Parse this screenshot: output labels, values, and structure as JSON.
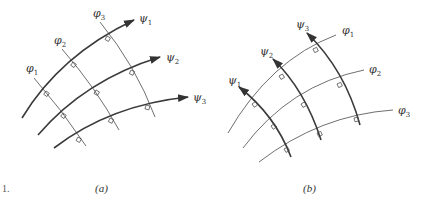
{
  "figure": {
    "number_fragment": "1.",
    "panels": [
      {
        "caption": "(a)",
        "description": "Streamlines psi (thick, arrowed) crossed orthogonally by equipotential lines phi (thin)",
        "streamlines": [
          {
            "symbol": "ψ",
            "index": "1"
          },
          {
            "symbol": "ψ",
            "index": "2"
          },
          {
            "symbol": "ψ",
            "index": "3"
          }
        ],
        "equipotentials": [
          {
            "symbol": "φ",
            "index": "1"
          },
          {
            "symbol": "φ",
            "index": "2"
          },
          {
            "symbol": "φ",
            "index": "3"
          }
        ]
      },
      {
        "caption": "(b)",
        "description": "Roles swapped: psi lines arrowed pointing up-left, phi curves thin",
        "streamlines": [
          {
            "symbol": "ψ",
            "index": "1"
          },
          {
            "symbol": "ψ",
            "index": "2"
          },
          {
            "symbol": "ψ",
            "index": "3"
          }
        ],
        "equipotentials": [
          {
            "symbol": "φ",
            "index": "1"
          },
          {
            "symbol": "φ",
            "index": "2"
          },
          {
            "symbol": "φ",
            "index": "3"
          }
        ]
      }
    ]
  }
}
